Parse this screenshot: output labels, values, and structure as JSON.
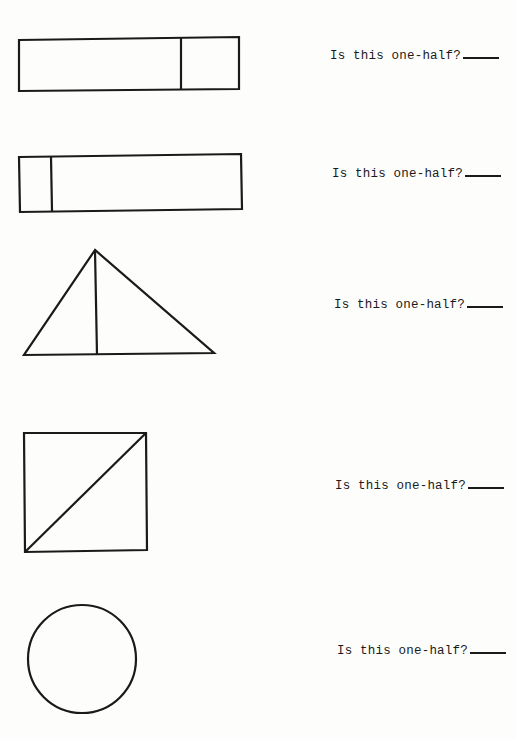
{
  "worksheet": {
    "items": [
      {
        "shape": "rectangle",
        "division": "vertical line near right end (unequal parts)",
        "question": "Is this one-half?",
        "answer": ""
      },
      {
        "shape": "rectangle",
        "division": "vertical line near left end (unequal parts)",
        "question": "Is this one-half?",
        "answer": ""
      },
      {
        "shape": "triangle",
        "division": "vertical line from apex to base (unequal parts)",
        "question": "Is this one-half?",
        "answer": ""
      },
      {
        "shape": "square",
        "division": "diagonal line corner to corner (equal parts)",
        "question": "Is this one-half?",
        "answer": ""
      },
      {
        "shape": "circle",
        "division": "none",
        "question": "Is this one-half?",
        "answer": ""
      }
    ]
  },
  "colors": {
    "ink": "#1a1a1a",
    "paper": "#fdfdfc"
  }
}
